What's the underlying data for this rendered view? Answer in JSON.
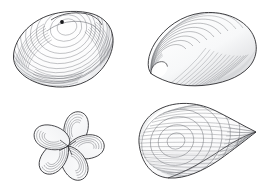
{
  "plate": {
    "title": "Bivalve shell illustrations",
    "background_color": "#ffffff",
    "ink_color": "#2b2b2f",
    "mid_tone_color": "#6f7177",
    "light_tone_color": "#a9abb1",
    "width": 267,
    "height": 187,
    "medium": "pen-and-ink line drawing",
    "figure_count": 4,
    "layout": "two-by-two grid, no captions or labels"
  },
  "figures": [
    {
      "id": "clam-quahog",
      "position": "top-left",
      "label": "Quahog clam valve, exterior view",
      "orientation": "umbo upper-center, hinge line to upper-right, ventral margin at bottom",
      "bounds": {
        "x": 13,
        "y": 10,
        "width": 100,
        "height": 78
      },
      "umbo": {
        "x": 62,
        "y": 22,
        "marking": "small filled dark beak dot"
      },
      "shading": "dense concentric growth striae along left and lower-left margin, open interior",
      "line_count_growth_rings": 26,
      "outline_color": "#2b2b2f"
    },
    {
      "id": "mussel-solid",
      "position": "top-right",
      "label": "Mussel valve with concentric growth rings",
      "orientation": "umbo (beak) at lower-left, broad dorsal curve sweeping to right",
      "bounds": {
        "x": 146,
        "y": 12,
        "width": 110,
        "height": 74
      },
      "umbo": {
        "x": 152,
        "y": 73,
        "marking": "pointed pale beak"
      },
      "shading": "nested arcs radiating from umbo, graded hatching toward ventral edge",
      "line_count_growth_rings": 22,
      "outline_color": "#2b2b2f"
    },
    {
      "id": "shell-rosette",
      "position": "bottom-left",
      "label": "Cluster of five small shell lobes in a pinwheel rosette",
      "orientation": "radial arrangement about a common center",
      "bounds": {
        "x": 35,
        "y": 110,
        "width": 70,
        "height": 70
      },
      "center": {
        "x": 68,
        "y": 146
      },
      "lobe_count": 5,
      "shading": "each lobe drawn with three to four concentric interior arcs",
      "outline_color": "#2b2b2f"
    },
    {
      "id": "mussel-wireframe",
      "position": "bottom-right",
      "label": "Mussel valve rendered as a wireframe mesh",
      "orientation": "rounded umbo at left, tapering to a point at right",
      "bounds": {
        "x": 138,
        "y": 104,
        "width": 122,
        "height": 76
      },
      "apex": {
        "x": 256,
        "y": 132
      },
      "mesh": {
        "concentric_ring_count": 7,
        "radial_line_count": 34,
        "description": "grid of concentric growth ellipses crossed by radial ribs"
      },
      "shading": "close radial ruling across lower body, open mesh on upper surface",
      "outline_color": "#2b2b2f"
    }
  ]
}
